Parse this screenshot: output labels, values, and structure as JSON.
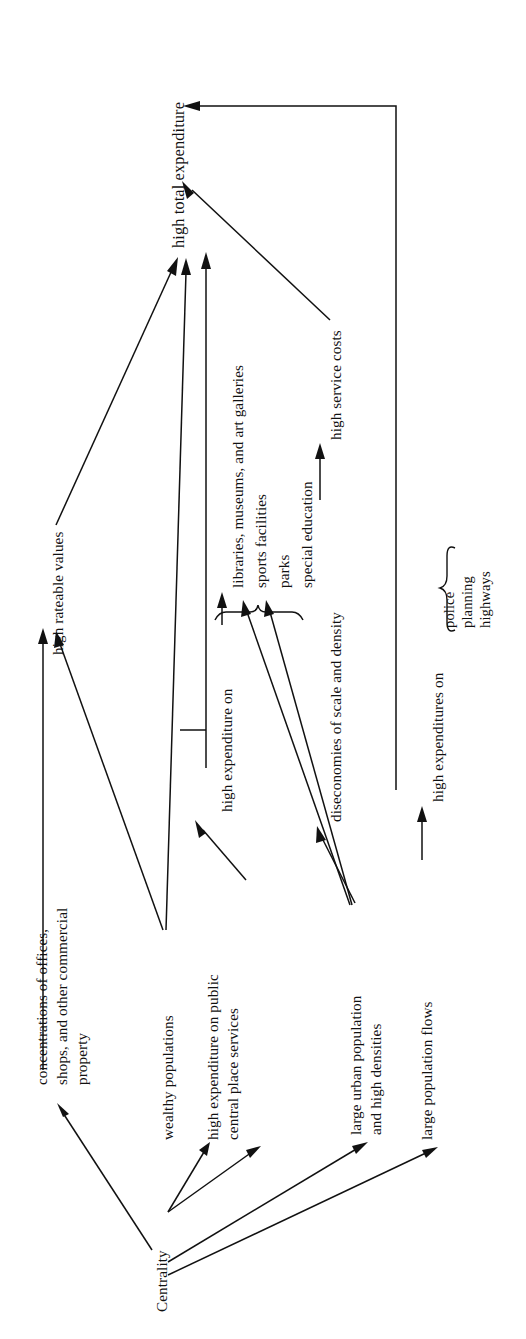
{
  "figure": {
    "type": "causal-flow-diagram",
    "orientation": "rotated-90-counterclockwise",
    "root": "Centrality"
  },
  "nodes": {
    "centrality": "Centrality",
    "concentrations": "concentrations of offices,\nshops, and other commercial\nproperty",
    "concentrations_l1": "concentrations of offices,",
    "concentrations_l2": "shops, and other commercial",
    "concentrations_l3": "property",
    "wealthy": "wealthy populations",
    "public_central_l1": "high expenditure on public",
    "public_central_l2": "central place services",
    "urban_pop_l1": "large urban population",
    "urban_pop_l2": "and high densities",
    "pop_flows": "large population flows",
    "rateable": "high rateable values",
    "high_expenditure_on": "high expenditure on",
    "diseconomies": "diseconomies of scale and density",
    "service_costs": "high service costs",
    "high_expenditures_on": "high expenditures on",
    "total": "high total expenditure"
  },
  "service_items": [
    "libraries, museums, and art galleries",
    "sports facilities",
    "parks",
    "special education"
  ],
  "brace_items": [
    "police",
    "planning",
    "highways"
  ],
  "edges": [
    {
      "from": "Centrality",
      "to": "concentrations of offices, shops, and other commercial property"
    },
    {
      "from": "Centrality",
      "to": "wealthy populations"
    },
    {
      "from": "Centrality",
      "to": "high expenditure on public central place services"
    },
    {
      "from": "Centrality",
      "to": "large urban population and high densities"
    },
    {
      "from": "Centrality",
      "to": "large population flows"
    },
    {
      "from": "concentrations of offices, shops, and other commercial property",
      "to": "high rateable values"
    },
    {
      "from": "wealthy populations",
      "to": "high rateable values"
    },
    {
      "from": "wealthy populations",
      "to": "high total expenditure"
    },
    {
      "from": "high expenditure on public central place services",
      "to": "high expenditure on"
    },
    {
      "from": "high expenditure on",
      "to": "libraries, museums, and art galleries"
    },
    {
      "from": "high expenditure on",
      "to": "high total expenditure"
    },
    {
      "from": "large urban population and high densities",
      "to": "sports facilities"
    },
    {
      "from": "large urban population and high densities",
      "to": "parks"
    },
    {
      "from": "large urban population and high densities",
      "to": "diseconomies of scale and density"
    },
    {
      "from": "diseconomies of scale and density",
      "to": "high service costs"
    },
    {
      "from": "high service costs",
      "to": "high total expenditure"
    },
    {
      "from": "large population flows",
      "to": "high expenditures on"
    },
    {
      "from": "high expenditures on",
      "to": "high total expenditure"
    },
    {
      "from": "high rateable values",
      "to": "high total expenditure"
    }
  ],
  "colors": {
    "ink": "#111111",
    "paper": "#ffffff"
  }
}
